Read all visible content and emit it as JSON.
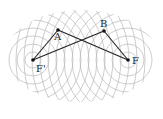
{
  "diagram": {
    "type": "two-foci concentric circles (ellipse/hyperbola construction)",
    "foci": [
      {
        "label": "F'",
        "x": 33,
        "y": 60
      },
      {
        "label": "F",
        "x": 128,
        "y": 60
      }
    ],
    "points": [
      {
        "label": "A",
        "x": 58,
        "y": 30
      },
      {
        "label": "B",
        "x": 104,
        "y": 31
      }
    ],
    "segments": [
      [
        "F'",
        "A"
      ],
      [
        "A",
        "F"
      ],
      [
        "F'",
        "B"
      ],
      [
        "B",
        "F"
      ]
    ],
    "circle_spacing": 8,
    "circle_count": 14,
    "colors": {
      "circles": "#b8b8b8",
      "lines": "#222222",
      "points": "#111111"
    }
  }
}
